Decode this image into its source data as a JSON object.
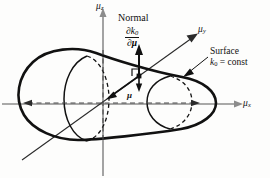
{
  "figure": {
    "name": "mu-space-surface-diagram",
    "background_color": "#fdfdfc",
    "ink_color": "#111111",
    "axis_color": "#8c8c8c"
  },
  "axes": {
    "x": {
      "label": "μ",
      "subscript": "x",
      "name": "mu-x-axis"
    },
    "y": {
      "label": "μ",
      "subscript": "y",
      "name": "mu-y-axis"
    },
    "z": {
      "label": "μ",
      "subscript": "z",
      "name": "mu-z-axis"
    }
  },
  "annotations": {
    "normal": {
      "title": "Normal",
      "numerator_partial": "∂k",
      "numerator_sub": "0",
      "denominator_partial": "∂",
      "denominator_var": "μ"
    },
    "surface": {
      "title": "Surface",
      "k_symbol": "k",
      "k_sub": "0",
      "equation_rest": "= const"
    },
    "mu_vector": {
      "label": "μ"
    }
  }
}
